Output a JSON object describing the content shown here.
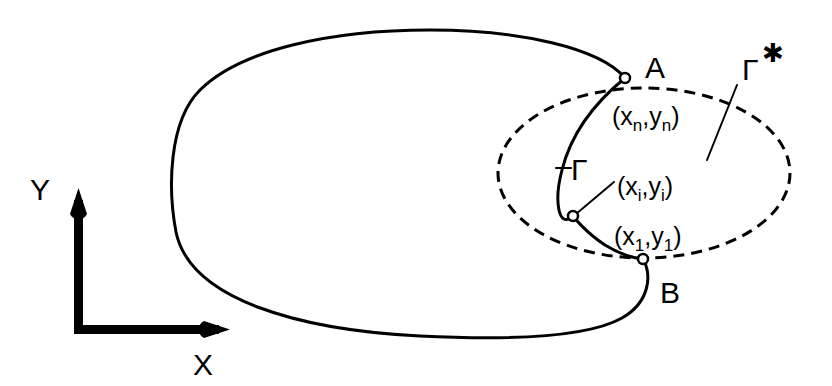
{
  "figure": {
    "background_color": "#ffffff",
    "ink_color": "#000000",
    "width": 832,
    "height": 386
  },
  "axes": {
    "x_label": "X",
    "y_label": "Y",
    "origin": {
      "x": 80,
      "y": 331
    },
    "x_tip": {
      "x": 228,
      "y": 331
    },
    "y_tip": {
      "x": 80,
      "y": 190
    }
  },
  "points": [
    {
      "id": "A",
      "label": "A",
      "marker": {
        "x": 625,
        "y": 78
      },
      "label_pos": {
        "x": 645,
        "y": 72
      }
    },
    {
      "id": "B",
      "label": "B",
      "marker": {
        "x": 643,
        "y": 259
      },
      "label_pos": {
        "x": 660,
        "y": 300
      }
    }
  ],
  "coordinate_labels": [
    {
      "id": "xn-yn",
      "open": "(x",
      "sub1": "n",
      "comma": ",y",
      "sub2": "n",
      "close": ")",
      "text": "(x_n,y_n)",
      "x": 612,
      "y": 125
    },
    {
      "id": "xi-yi",
      "open": "(x",
      "sub1": "i",
      "comma": ",y",
      "sub2": "i",
      "close": ")",
      "text": "(x_i,y_i)",
      "x": 617,
      "y": 195
    },
    {
      "id": "x1-y1",
      "open": "(x",
      "sub1": "1",
      "comma": ",y",
      "sub2": "1",
      "close": ")",
      "text": "(x_1,y_1)",
      "x": 614,
      "y": 245
    }
  ],
  "curve_labels": [
    {
      "id": "gamma",
      "text": "Γ",
      "star": "",
      "x": 571,
      "y": 178
    },
    {
      "id": "gamma-star",
      "text": "Γ",
      "star": "✱",
      "x": 745,
      "y": 75
    }
  ],
  "markers": [
    {
      "id": "node-A",
      "x": 625,
      "y": 78,
      "r": 5
    },
    {
      "id": "node-i",
      "x": 573,
      "y": 216,
      "r": 5
    },
    {
      "id": "node-B",
      "x": 643,
      "y": 259,
      "r": 5
    }
  ],
  "curves": {
    "outer_solid_loop": {
      "name": "outer-solid-loop",
      "style": "solid",
      "path": "M 625 78 C 600 48 520 30 430 30 C 330 30 240 50 200 90 C 168 122 168 190 176 232 C 190 300 300 330 420 336 C 520 341 590 336 622 318 C 650 302 652 275 643 259"
    },
    "inner_solid_arc": {
      "name": "inner-solid-arc-gamma",
      "style": "solid",
      "path": "M 625 78 C 598 100 572 130 562 170 C 554 200 558 230 573 216 C 573 216 585 232 605 245 C 618 253 633 258 643 259"
    },
    "dashed_oval": {
      "name": "dashed-oval-gamma-star",
      "style": "dashed",
      "center": {
        "x": 644,
        "y": 173
      },
      "rx": 146,
      "ry": 85
    },
    "leader_gamma": {
      "name": "gamma-leader-line",
      "style": "thin",
      "path": "M 556 168 L 571 168"
    },
    "leader_xi": {
      "name": "xi-leader-line",
      "style": "thin",
      "path": "M 576 214 L 614 182"
    },
    "arrow_gamma_star": {
      "name": "gamma-star-arrow",
      "style": "thin",
      "path": "M 707 160 L 737 85 L 723 120 L 707 160 Z"
    }
  }
}
